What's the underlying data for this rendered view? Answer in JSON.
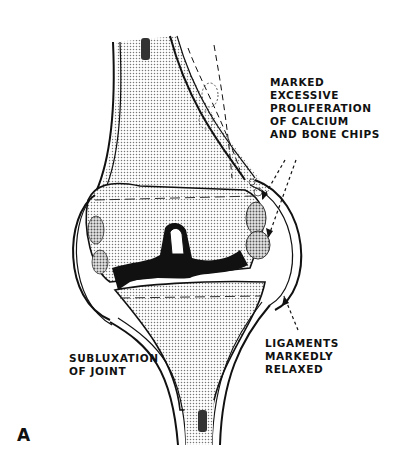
{
  "figure": {
    "panel_letter": "A",
    "colors": {
      "ink": "#111111",
      "background": "#ffffff",
      "bone_stipple": "#bdbdbd"
    }
  },
  "labels": {
    "calcium": {
      "lines": [
        "MARKED",
        "EXCESSIVE",
        "PROLIFERATION",
        "OF CALCIUM",
        "AND BONE CHIPS"
      ]
    },
    "ligaments": {
      "lines": [
        "LIGAMENTS",
        "MARKEDLY",
        "RELAXED"
      ]
    },
    "subluxation": {
      "lines": [
        "SUBLUXATION",
        "OF JOINT"
      ]
    }
  }
}
